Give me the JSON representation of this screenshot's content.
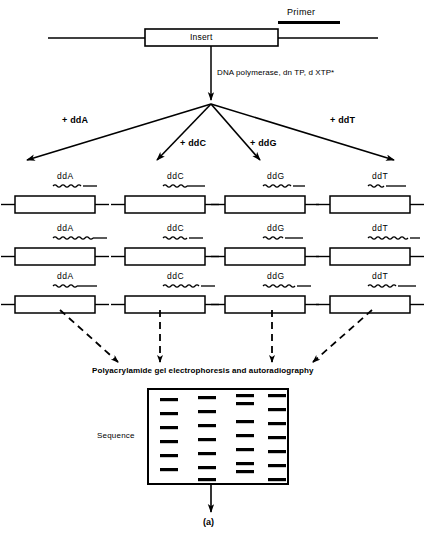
{
  "figure": {
    "caption": "(a)",
    "top": {
      "primer_label": "Primer",
      "insert_label": "Insert",
      "enzyme_label": "DNA polymerase, dn TP, d XTP*"
    },
    "branches": [
      {
        "label": "+ ddA"
      },
      {
        "label": "+ ddC"
      },
      {
        "label": "+ ddG"
      },
      {
        "label": "+ ddT"
      }
    ],
    "columns": [
      {
        "label": "ddA"
      },
      {
        "label": "ddC"
      },
      {
        "label": "ddG"
      },
      {
        "label": "ddT"
      }
    ],
    "gel": {
      "title": "Polyacrylamide gel electrophoresis and autoradiography",
      "sequence_label": "Sequence"
    },
    "colors": {
      "ink": "#000000",
      "paper": "#ffffff"
    }
  },
  "chart_data": {
    "type": "diagram",
    "rows": [
      {
        "row": 1,
        "fragments": [
          {
            "terminator": "ddA",
            "wave_length": 30,
            "tail_length": 14
          },
          {
            "terminator": "ddC",
            "wave_length": 24,
            "tail_length": 18
          },
          {
            "terminator": "ddG",
            "wave_length": 30,
            "tail_length": 12
          },
          {
            "terminator": "ddT",
            "wave_length": 18,
            "tail_length": 20
          }
        ]
      },
      {
        "row": 2,
        "fragments": [
          {
            "terminator": "ddA",
            "wave_length": 40,
            "tail_length": 14
          },
          {
            "terminator": "ddC",
            "wave_length": 26,
            "tail_length": 14
          },
          {
            "terminator": "ddG",
            "wave_length": 22,
            "tail_length": 18
          },
          {
            "terminator": "ddT",
            "wave_length": 42,
            "tail_length": 10
          }
        ]
      },
      {
        "row": 3,
        "fragments": [
          {
            "terminator": "ddA",
            "wave_length": 24,
            "tail_length": 20
          },
          {
            "terminator": "ddC",
            "wave_length": 38,
            "tail_length": 14
          },
          {
            "terminator": "ddG",
            "wave_length": 34,
            "tail_length": 14
          },
          {
            "terminator": "ddT",
            "wave_length": 30,
            "tail_length": 18
          }
        ]
      }
    ],
    "gel_lanes": [
      {
        "lane": 1,
        "terminator": "ddA",
        "bands": [
          398,
          412,
          426,
          440,
          454,
          468
        ]
      },
      {
        "lane": 2,
        "terminator": "ddC",
        "bands": [
          396,
          410,
          424,
          438,
          452,
          466,
          478
        ]
      },
      {
        "lane": 3,
        "terminator": "ddG",
        "bands": [
          394,
          402,
          420,
          434,
          448,
          462,
          470
        ]
      },
      {
        "lane": 4,
        "terminator": "ddT",
        "bands": [
          394,
          408,
          422,
          436,
          450,
          464,
          478
        ]
      }
    ],
    "band_counts": [
      6,
      7,
      7,
      7
    ]
  }
}
